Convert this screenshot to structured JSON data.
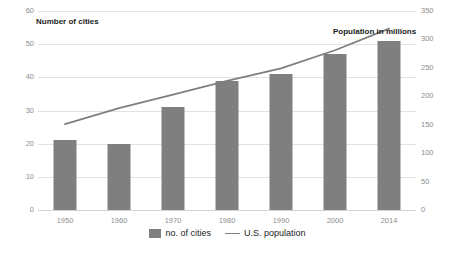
{
  "chart_data": {
    "type": "bar",
    "title": "",
    "categories": [
      "1950",
      "1960",
      "1970",
      "1980",
      "1990",
      "2000",
      "2014"
    ],
    "series": [
      {
        "name": "no. of cities",
        "type": "bar",
        "axis": "left",
        "values": [
          21,
          20,
          31,
          39,
          41,
          47,
          51
        ]
      },
      {
        "name": "U.S. population",
        "type": "line",
        "axis": "right",
        "values": [
          151,
          179,
          203,
          227,
          249,
          281,
          319
        ]
      }
    ],
    "xlabel": "",
    "ylabel": "Number of cities",
    "y2label": "Population in millions",
    "ylim": [
      0,
      60
    ],
    "y2lim": [
      0,
      350
    ],
    "yticks": [
      0,
      10,
      20,
      30,
      40,
      50,
      60
    ],
    "y2ticks": [
      0,
      50,
      100,
      150,
      200,
      250,
      300,
      350
    ],
    "grid": true,
    "legend_position": "bottom",
    "annotations": [
      {
        "name": "left-axis-title",
        "text": "Number of cities"
      },
      {
        "name": "right-axis-title",
        "text": "Population in millions"
      }
    ]
  },
  "axes": {
    "left_ticks": [
      "60",
      "50",
      "40",
      "30",
      "20",
      "10",
      "0"
    ],
    "right_ticks": [
      "350",
      "300",
      "250",
      "200",
      "150",
      "100",
      "50",
      "0"
    ],
    "x_ticks": [
      "1950",
      "1960",
      "1970",
      "1980",
      "1990",
      "2000",
      "2014"
    ]
  },
  "labels": {
    "left_axis_title": "Number of cities",
    "right_axis_title": "Population in millions"
  },
  "legend": {
    "items": [
      {
        "label": "no. of cities",
        "marker": "bar-swatch",
        "color": "#7f7f7f"
      },
      {
        "label": "U.S. population",
        "marker": "line-swatch",
        "color": "#7f7f7f"
      }
    ]
  },
  "colors": {
    "bar": "#7f7f7f",
    "line": "#7f7f7f",
    "grid": "#e3e3e3",
    "tick_text": "#8d8d8d",
    "title_text": "#1a1a1a",
    "background": "#ffffff"
  }
}
